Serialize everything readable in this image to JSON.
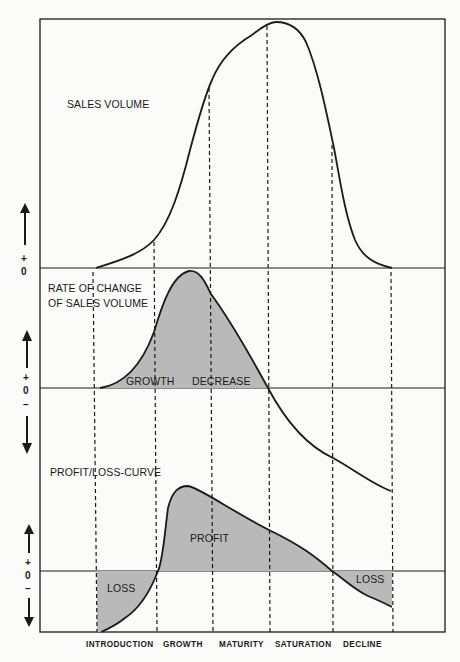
{
  "diagram": {
    "colors": {
      "ink": "#1a1a1a",
      "fill": "#b9b9b9",
      "background": "#fbfbf9"
    },
    "panels": [
      {
        "id": "sales",
        "label": "SALES VOLUME",
        "axis": {
          "plus": "+",
          "zero": "0"
        }
      },
      {
        "id": "rate",
        "label_line1": "RATE OF CHANGE",
        "label_line2": "OF SALES VOLUME",
        "regions": {
          "growth": "GROWTH",
          "decrease": "DECREASE"
        },
        "axis": {
          "plus": "+",
          "zero": "0",
          "minus": "–"
        }
      },
      {
        "id": "profit",
        "label": "PROFIT/LOSS-CURVE",
        "regions": {
          "profit": "PROFIT",
          "loss_left": "LOSS",
          "loss_right": "LOSS"
        },
        "axis": {
          "plus": "+",
          "zero": "0",
          "minus": "–"
        }
      }
    ],
    "stages": [
      "INTRODUCTION",
      "GROWTH",
      "MATURITY",
      "SATURATION",
      "DECLINE"
    ]
  }
}
